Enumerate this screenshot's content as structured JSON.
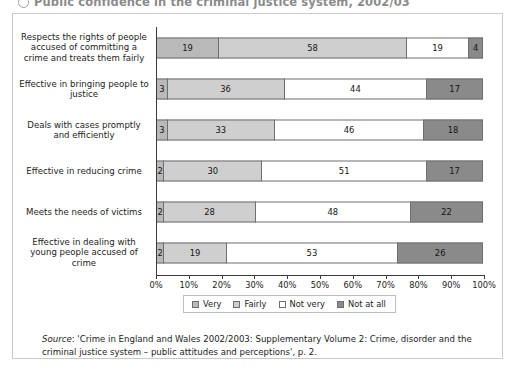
{
  "title": {
    "text": "Public confidence in the criminal justice system, 2002/03",
    "bullet_icon": "circle-bullet-icon"
  },
  "chart_data": {
    "type": "bar",
    "orientation": "horizontal",
    "stacked": true,
    "normalized_percent": true,
    "title": "Public confidence in the criminal justice system, 2002/03",
    "xlabel": "",
    "ylabel": "",
    "xlim": [
      0,
      100
    ],
    "grid": false,
    "legend_position": "bottom",
    "xtick_labels": [
      "0%",
      "10%",
      "20%",
      "30%",
      "40%",
      "50%",
      "60%",
      "70%",
      "80%",
      "90%",
      "100%"
    ],
    "xticks": [
      0,
      10,
      20,
      30,
      40,
      50,
      60,
      70,
      80,
      90,
      100
    ],
    "categories": [
      "Respects the rights of people accused of committing a crime and treats them fairly",
      "Effective in bringing people to justice",
      "Deals with cases promptly and efficiently",
      "Effective in reducing crime",
      "Meets the needs of victims",
      "Effective in dealing with young people accused of crime"
    ],
    "series": [
      {
        "name": "Very",
        "color": "#b9b9b9",
        "values": [
          19,
          3,
          3,
          2,
          2,
          2
        ]
      },
      {
        "name": "Fairly",
        "color": "#cfcfcf",
        "values": [
          58,
          36,
          33,
          30,
          28,
          19
        ]
      },
      {
        "name": "Not very",
        "color": "#ffffff",
        "values": [
          19,
          44,
          46,
          51,
          48,
          53
        ]
      },
      {
        "name": "Not at all",
        "color": "#8a8a8a",
        "values": [
          4,
          17,
          18,
          17,
          22,
          26
        ]
      }
    ]
  },
  "source": {
    "label": "Source",
    "text": ": 'Crime in England and Wales 2002/2003: Supplementary Volume 2: Crime, disorder and the criminal justice system – public attitudes and perceptions', p. 2."
  }
}
